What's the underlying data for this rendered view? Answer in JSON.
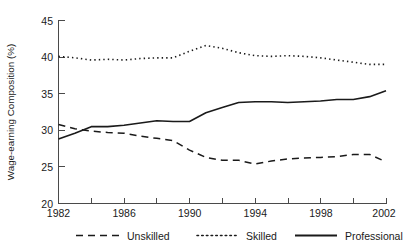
{
  "chart_data": {
    "type": "line",
    "title": "",
    "xlabel": "",
    "ylabel": "Wage-earning Composition (%)",
    "xlim": [
      1982,
      2002
    ],
    "ylim": [
      20,
      45
    ],
    "grid": false,
    "legend_position": "bottom",
    "x_ticks_labeled": [
      "1982",
      "1986",
      "1990",
      "1994",
      "1998",
      "2002"
    ],
    "x_ticks_labeled_values": [
      1982,
      1986,
      1990,
      1994,
      1998,
      2002
    ],
    "x_ticks_minor_values": [
      1984,
      1988,
      1992,
      1996,
      2000
    ],
    "y_ticks": [
      "20",
      "25",
      "30",
      "35",
      "40",
      "45"
    ],
    "y_ticks_values": [
      20,
      25,
      30,
      35,
      40,
      45
    ],
    "x": [
      1982,
      1983,
      1984,
      1985,
      1986,
      1987,
      1988,
      1989,
      1990,
      1991,
      1992,
      1993,
      1994,
      1995,
      1996,
      1997,
      1998,
      1999,
      2000,
      2001,
      2002
    ],
    "series": [
      {
        "name": "Unskilled",
        "style": "dashed",
        "color": "#1a1a1a",
        "values": [
          30.8,
          30.2,
          29.9,
          29.7,
          29.6,
          29.2,
          28.9,
          28.6,
          27.3,
          26.3,
          25.9,
          25.9,
          25.4,
          25.8,
          26.1,
          26.2,
          26.3,
          26.4,
          26.7,
          26.7,
          25.7
        ]
      },
      {
        "name": "Skilled",
        "style": "dotted",
        "color": "#1a1a1a",
        "values": [
          40.1,
          39.9,
          39.6,
          39.7,
          39.6,
          39.8,
          39.9,
          39.9,
          40.8,
          41.6,
          41.2,
          40.6,
          40.2,
          40.1,
          40.2,
          40.1,
          39.9,
          39.6,
          39.3,
          39.0,
          39.0
        ]
      },
      {
        "name": "Professional",
        "style": "solid",
        "color": "#1a1a1a",
        "values": [
          28.8,
          29.6,
          30.5,
          30.5,
          30.7,
          31.0,
          31.3,
          31.2,
          31.2,
          32.4,
          33.1,
          33.8,
          33.9,
          33.9,
          33.8,
          33.9,
          34.0,
          34.2,
          34.2,
          34.6,
          35.4
        ]
      }
    ],
    "legend": [
      {
        "label": "Unskilled",
        "style": "dashed"
      },
      {
        "label": "Skilled",
        "style": "dotted"
      },
      {
        "label": "Professional",
        "style": "solid"
      }
    ]
  }
}
